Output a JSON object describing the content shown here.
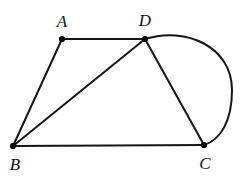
{
  "figure": {
    "background_color": "#fefefe",
    "stroke_color": "#151515",
    "vertex_color": "#050505",
    "label_color": "#111111",
    "width": 250,
    "height": 177
  },
  "points": [
    {
      "id": "A",
      "label": "A",
      "x": 62,
      "y": 39,
      "label_x": 62,
      "label_y": 21
    },
    {
      "id": "D",
      "label": "D",
      "x": 145,
      "y": 39,
      "label_x": 145,
      "label_y": 20
    },
    {
      "id": "B",
      "label": "B",
      "x": 13,
      "y": 146,
      "label_x": 15,
      "label_y": 164
    },
    {
      "id": "C",
      "label": "C",
      "x": 204,
      "y": 145,
      "label_x": 205,
      "label_y": 163
    }
  ],
  "segments": [
    {
      "id": "AD",
      "from": "A",
      "to": "D",
      "path": "M 62 39 L 145 39"
    },
    {
      "id": "AB",
      "from": "A",
      "to": "B",
      "path": "M 62 39 L 13 146"
    },
    {
      "id": "BD",
      "from": "B",
      "to": "D",
      "path": "M 13 146 L 145 39"
    },
    {
      "id": "BC",
      "from": "B",
      "to": "C",
      "path": "M 13 146 L 204 145"
    },
    {
      "id": "DC",
      "from": "D",
      "to": "C",
      "path": "M 145 39 L 204 145"
    }
  ],
  "arcs": [
    {
      "id": "DC-arc",
      "from": "D",
      "to": "C",
      "bulge_direction": "right",
      "apex_x": 232,
      "apex_y": 88,
      "path": "M 145 39 C 186 26 232 47 232 90 C 232 122 220 140 204 145"
    }
  ],
  "vertex_dot_radius": 3.1
}
